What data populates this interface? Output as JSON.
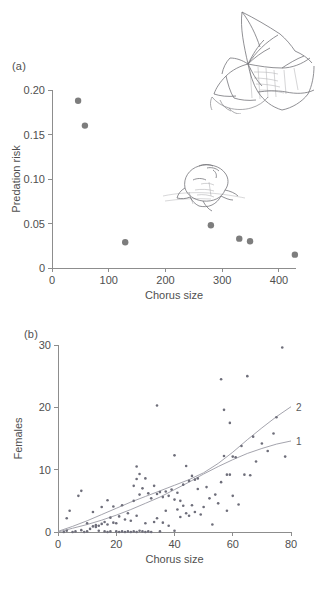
{
  "figure": {
    "panel_a_label": "(a)",
    "panel_b_label": "(b)",
    "caption_clipped": ""
  },
  "illustrations": [
    {
      "name": "bat-illustration",
      "subject": "bat in flight with spread wings"
    },
    {
      "name": "frog-illustration",
      "subject": "calling frog at water surface"
    }
  ],
  "chart_data": [
    {
      "panel": "(a)",
      "type": "scatter",
      "title": "",
      "xlabel": "Chorus size",
      "ylabel": "Predation risk",
      "xlim": [
        0,
        430
      ],
      "ylim": [
        0,
        0.2
      ],
      "xticks": [
        0,
        100,
        200,
        300,
        400
      ],
      "xticklabels": [
        "0",
        "100",
        "200",
        "300",
        "400"
      ],
      "yticks": [
        0,
        0.05,
        0.1,
        0.15,
        0.2
      ],
      "yticklabels": [
        "0",
        "0.05",
        "0.10",
        "0.15",
        "0.20"
      ],
      "grid": false,
      "legend": "none",
      "marker": "filled-circle",
      "marker_color": "#7d7d7d",
      "points": [
        {
          "x": 46,
          "y": 0.188
        },
        {
          "x": 58,
          "y": 0.16
        },
        {
          "x": 129,
          "y": 0.029
        },
        {
          "x": 280,
          "y": 0.048
        },
        {
          "x": 330,
          "y": 0.033
        },
        {
          "x": 349,
          "y": 0.03
        },
        {
          "x": 428,
          "y": 0.015
        }
      ]
    },
    {
      "panel": "(b)",
      "type": "scatter",
      "title": "",
      "xlabel": "Chorus size",
      "ylabel": "Females",
      "xlim": [
        0,
        80
      ],
      "ylim": [
        0,
        30
      ],
      "xticks": [
        0,
        20,
        40,
        60,
        80
      ],
      "xticklabels": [
        "0",
        "20",
        "40",
        "60",
        "80"
      ],
      "yticks": [
        0,
        10,
        20,
        30
      ],
      "yticklabels": [
        "0",
        "10",
        "20",
        "30"
      ],
      "grid": false,
      "legend": "none",
      "marker": "small-dot",
      "marker_color": "#6e6e7a",
      "curves": [
        {
          "label": "1",
          "kind": "linear-fit",
          "color": "#9a9aa4",
          "points": [
            [
              0,
              0.0
            ],
            [
              5,
              0.6
            ],
            [
              10,
              1.2
            ],
            [
              15,
              1.9
            ],
            [
              20,
              2.7
            ],
            [
              25,
              3.6
            ],
            [
              30,
              4.6
            ],
            [
              35,
              5.6
            ],
            [
              40,
              6.8
            ],
            [
              45,
              8.0
            ],
            [
              50,
              9.3
            ],
            [
              55,
              10.5
            ],
            [
              60,
              11.6
            ],
            [
              65,
              12.6
            ],
            [
              70,
              13.4
            ],
            [
              75,
              14.1
            ],
            [
              80,
              14.6
            ]
          ]
        },
        {
          "label": "2",
          "kind": "exponential-fit",
          "color": "#9a9aa4",
          "points": [
            [
              0,
              0.1
            ],
            [
              5,
              0.9
            ],
            [
              10,
              1.8
            ],
            [
              15,
              2.8
            ],
            [
              20,
              3.8
            ],
            [
              25,
              4.8
            ],
            [
              30,
              5.7
            ],
            [
              35,
              6.6
            ],
            [
              40,
              7.5
            ],
            [
              45,
              8.4
            ],
            [
              50,
              9.5
            ],
            [
              55,
              11.0
            ],
            [
              60,
              12.8
            ],
            [
              65,
              14.8
            ],
            [
              70,
              16.7
            ],
            [
              75,
              18.5
            ],
            [
              80,
              20.1
            ]
          ]
        }
      ],
      "points": [
        {
          "x": 2,
          "y": 0.0
        },
        {
          "x": 3,
          "y": 2.2
        },
        {
          "x": 3,
          "y": 0.2
        },
        {
          "x": 4,
          "y": 3.4
        },
        {
          "x": 5,
          "y": 0.0
        },
        {
          "x": 6,
          "y": 0.1
        },
        {
          "x": 7,
          "y": 5.8
        },
        {
          "x": 8,
          "y": 0.3
        },
        {
          "x": 8,
          "y": 6.6
        },
        {
          "x": 9,
          "y": 0.0
        },
        {
          "x": 10,
          "y": 1.4
        },
        {
          "x": 10,
          "y": 0.1
        },
        {
          "x": 11,
          "y": 0.5
        },
        {
          "x": 12,
          "y": 3.2
        },
        {
          "x": 12,
          "y": 0.9
        },
        {
          "x": 13,
          "y": 0.8
        },
        {
          "x": 13,
          "y": 1.1
        },
        {
          "x": 14,
          "y": 1.0
        },
        {
          "x": 14,
          "y": 0.2
        },
        {
          "x": 15,
          "y": 4.0
        },
        {
          "x": 15,
          "y": 1.3
        },
        {
          "x": 16,
          "y": 0.1
        },
        {
          "x": 16,
          "y": 1.6
        },
        {
          "x": 17,
          "y": 5.1
        },
        {
          "x": 17,
          "y": 0.0
        },
        {
          "x": 17,
          "y": 1.2
        },
        {
          "x": 18,
          "y": 2.3
        },
        {
          "x": 18,
          "y": 0.1
        },
        {
          "x": 19,
          "y": 1.5
        },
        {
          "x": 19,
          "y": 4.1
        },
        {
          "x": 20,
          "y": 0.1
        },
        {
          "x": 20,
          "y": 1.4
        },
        {
          "x": 21,
          "y": 0.0
        },
        {
          "x": 21,
          "y": 2.5
        },
        {
          "x": 22,
          "y": 4.3
        },
        {
          "x": 22,
          "y": 0.1
        },
        {
          "x": 23,
          "y": 0.0
        },
        {
          "x": 23,
          "y": 2.0
        },
        {
          "x": 24,
          "y": 0.1
        },
        {
          "x": 24,
          "y": 3.0
        },
        {
          "x": 25,
          "y": 0.0
        },
        {
          "x": 25,
          "y": 1.8
        },
        {
          "x": 26,
          "y": 0.1
        },
        {
          "x": 26,
          "y": 7.4
        },
        {
          "x": 26,
          "y": 5.0
        },
        {
          "x": 27,
          "y": 10.5
        },
        {
          "x": 27,
          "y": 8.5
        },
        {
          "x": 27,
          "y": 0.0
        },
        {
          "x": 27,
          "y": 2.6
        },
        {
          "x": 28,
          "y": 9.3
        },
        {
          "x": 28,
          "y": 0.2
        },
        {
          "x": 28,
          "y": 6.0
        },
        {
          "x": 29,
          "y": 0.1
        },
        {
          "x": 29,
          "y": 7.0
        },
        {
          "x": 30,
          "y": 0.0
        },
        {
          "x": 30,
          "y": 1.4
        },
        {
          "x": 30,
          "y": 8.6
        },
        {
          "x": 31,
          "y": 0.1
        },
        {
          "x": 31,
          "y": 6.2
        },
        {
          "x": 32,
          "y": 0.0
        },
        {
          "x": 32,
          "y": 5.4
        },
        {
          "x": 33,
          "y": 7.4
        },
        {
          "x": 33,
          "y": 1.6
        },
        {
          "x": 34,
          "y": 20.3
        },
        {
          "x": 34,
          "y": 6.1
        },
        {
          "x": 34,
          "y": 2.2
        },
        {
          "x": 35,
          "y": 6.4
        },
        {
          "x": 35,
          "y": 0.1
        },
        {
          "x": 36,
          "y": 5.6
        },
        {
          "x": 36,
          "y": 1.5
        },
        {
          "x": 37,
          "y": 6.5
        },
        {
          "x": 37,
          "y": 3.4
        },
        {
          "x": 38,
          "y": 5.8
        },
        {
          "x": 38,
          "y": 1.0
        },
        {
          "x": 39,
          "y": 6.8
        },
        {
          "x": 40,
          "y": 12.3
        },
        {
          "x": 40,
          "y": 5.2
        },
        {
          "x": 40,
          "y": 0.2
        },
        {
          "x": 41,
          "y": 3.6
        },
        {
          "x": 41,
          "y": 6.3
        },
        {
          "x": 42,
          "y": 2.4
        },
        {
          "x": 42,
          "y": 5.0
        },
        {
          "x": 43,
          "y": 4.2
        },
        {
          "x": 43,
          "y": 7.6
        },
        {
          "x": 44,
          "y": 3.0
        },
        {
          "x": 44,
          "y": 10.6
        },
        {
          "x": 45,
          "y": 8.2
        },
        {
          "x": 45,
          "y": 2.6
        },
        {
          "x": 46,
          "y": 9.0
        },
        {
          "x": 46,
          "y": 4.3
        },
        {
          "x": 47,
          "y": 8.4
        },
        {
          "x": 47,
          "y": 3.2
        },
        {
          "x": 48,
          "y": 8.6
        },
        {
          "x": 48,
          "y": 6.9
        },
        {
          "x": 49,
          "y": 2.8
        },
        {
          "x": 50,
          "y": 4.0
        },
        {
          "x": 51,
          "y": 7.2
        },
        {
          "x": 52,
          "y": 5.4
        },
        {
          "x": 53,
          "y": 1.2
        },
        {
          "x": 54,
          "y": 6.0
        },
        {
          "x": 55,
          "y": 4.6
        },
        {
          "x": 56,
          "y": 24.5
        },
        {
          "x": 56,
          "y": 8.0
        },
        {
          "x": 57,
          "y": 19.6
        },
        {
          "x": 57,
          "y": 12.2
        },
        {
          "x": 58,
          "y": 3.4
        },
        {
          "x": 58,
          "y": 9.2
        },
        {
          "x": 59,
          "y": 17.5
        },
        {
          "x": 59,
          "y": 9.2
        },
        {
          "x": 60,
          "y": 12.1
        },
        {
          "x": 60,
          "y": 5.8
        },
        {
          "x": 61,
          "y": 12.0
        },
        {
          "x": 62,
          "y": 4.4
        },
        {
          "x": 63,
          "y": 13.8
        },
        {
          "x": 64,
          "y": 9.2
        },
        {
          "x": 65,
          "y": 25.0
        },
        {
          "x": 66,
          "y": 9.1
        },
        {
          "x": 67,
          "y": 15.3
        },
        {
          "x": 68,
          "y": 11.3
        },
        {
          "x": 70,
          "y": 14.2
        },
        {
          "x": 72,
          "y": 13.0
        },
        {
          "x": 74,
          "y": 15.8
        },
        {
          "x": 75,
          "y": 18.4
        },
        {
          "x": 77,
          "y": 29.6
        },
        {
          "x": 78,
          "y": 12.1
        }
      ]
    }
  ]
}
